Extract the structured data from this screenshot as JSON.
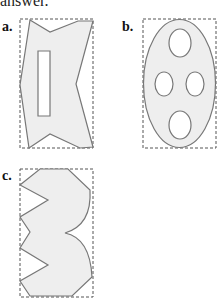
{
  "header": {
    "text": "answer."
  },
  "figures": [
    {
      "label": "a.",
      "description": "irregular polygon with V-notches top, bottom and right, with rectangular hole"
    },
    {
      "label": "b.",
      "description": "ellipse with four elliptical holes"
    },
    {
      "label": "c.",
      "description": "polygon with zigzag left edge and two arcs on right"
    }
  ],
  "colors": {
    "fill": "#eeeeee",
    "stroke": "#777777",
    "box": "#555555"
  }
}
